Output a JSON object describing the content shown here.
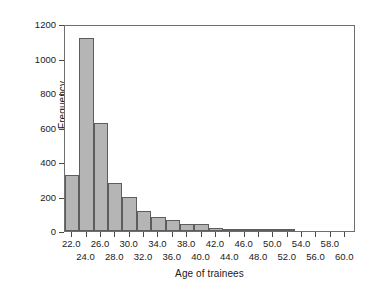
{
  "chart_data": {
    "type": "bar",
    "title": "",
    "subtitle": "",
    "xlabel": "Age of trainees",
    "ylabel": "Frequency",
    "grid": false,
    "legend": null,
    "xlim": [
      21.0,
      61.5
    ],
    "ylim": [
      0,
      1200
    ],
    "bin_width": 2.0,
    "x_tick_labels": [
      "22.0",
      "24.0",
      "26.0",
      "28.0",
      "30.0",
      "32.0",
      "34.0",
      "36.0",
      "38.0",
      "40.0",
      "42.0",
      "44.0",
      "46.0",
      "48.0",
      "50.0",
      "52.0",
      "54.0",
      "56.0",
      "58.0",
      "60.0"
    ],
    "x_tick_values": [
      22.0,
      24.0,
      26.0,
      28.0,
      30.0,
      32.0,
      34.0,
      36.0,
      38.0,
      40.0,
      42.0,
      44.0,
      46.0,
      48.0,
      50.0,
      52.0,
      54.0,
      56.0,
      58.0,
      60.0
    ],
    "y_tick_labels": [
      "0",
      "200",
      "400",
      "600",
      "800",
      "1000",
      "1200"
    ],
    "y_tick_values": [
      0,
      200,
      400,
      600,
      800,
      1000,
      1200
    ],
    "bin_centers": [
      22.0,
      24.0,
      26.0,
      28.0,
      30.0,
      32.0,
      34.0,
      36.0,
      38.0,
      40.0,
      42.0,
      44.0,
      46.0,
      48.0,
      50.0,
      52.0
    ],
    "categories": [
      "22.0",
      "24.0",
      "26.0",
      "28.0",
      "30.0",
      "32.0",
      "34.0",
      "36.0",
      "38.0",
      "40.0",
      "42.0",
      "44.0",
      "46.0",
      "48.0",
      "50.0",
      "52.0"
    ],
    "values": [
      325,
      1120,
      625,
      280,
      200,
      115,
      80,
      65,
      42,
      42,
      20,
      13,
      13,
      10,
      5,
      8
    ],
    "bar_color": "#b5b5b5",
    "bar_edge_color": "#5d5d5d",
    "axis_color": "#6e6e6e",
    "text_color": "#1a1a1a",
    "background_color": "#ffffff"
  }
}
